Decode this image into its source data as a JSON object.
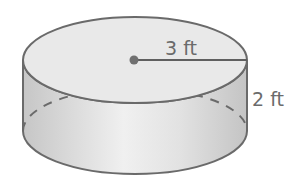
{
  "figure": {
    "shape": "cylinder",
    "radius_label": "3 ft",
    "height_label": "2 ft",
    "colors": {
      "top_face": "#e9e9e9",
      "side_dark": "#c9c9c9",
      "side_light": "#f2f2f2",
      "stroke": "#6a6a6a",
      "text": "#6b6b6b"
    }
  }
}
